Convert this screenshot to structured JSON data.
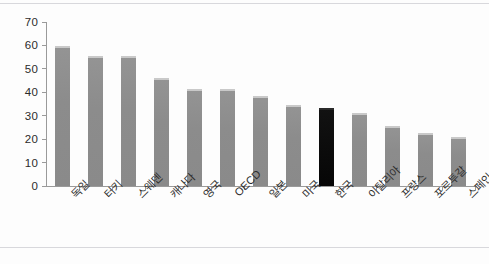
{
  "chart_data": {
    "type": "bar",
    "title": "",
    "subtitle": "",
    "xlabel": "",
    "ylabel": "",
    "ylim": [
      0,
      70
    ],
    "yticks": [
      0,
      10,
      20,
      30,
      40,
      50,
      60,
      70
    ],
    "grid": false,
    "legend": null,
    "categories": [
      "독일",
      "터키",
      "스웨덴",
      "캐나다",
      "영국",
      "OECD",
      "일본",
      "미국",
      "한국",
      "이탈리아",
      "프랑스",
      "포르투갈",
      "스페인"
    ],
    "values": [
      59.8,
      55.5,
      55.5,
      46.0,
      41.5,
      41.5,
      38.5,
      34.7,
      33.5,
      31.0,
      25.5,
      22.5,
      21.0
    ],
    "highlight_index": 8,
    "colors": {
      "bar": "#8a8a8a",
      "bar_highlight": "#0a0a0a",
      "axis": "#9a9a9a",
      "text": "#2d2d2d",
      "background": "#fdfdfd"
    }
  }
}
